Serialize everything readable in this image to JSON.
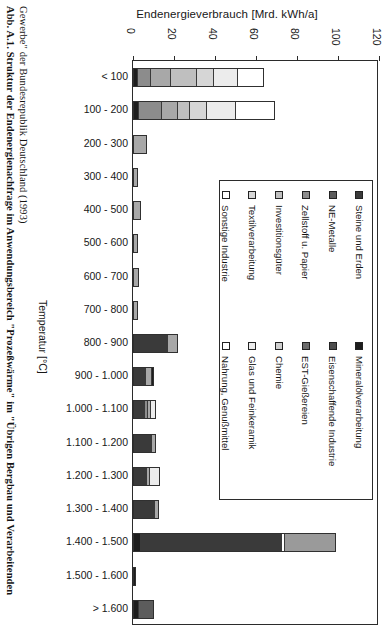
{
  "caption": {
    "line1_bold": "Abb. A.1.",
    "line1_rest": " Struktur der  Endenergienachfrage im Anwendungsb",
    "line1": "Abb. A.1. Struktur der  Endenergienachfrage im Anwendungsbereich \"Prozeßwärme\" im \"Übrigen Bergbau und Verarbeitenden",
    "line2": "Gewerbe\" der Bundesrepublik Deutschland (1993)"
  },
  "chart_data": {
    "type": "bar",
    "orientation": "horizontal-stacked",
    "title": "Endenergieverbrauch [Mrd. kWh/a]",
    "xlabel": "Endenergieverbrauch [Mrd. kWh/a]",
    "ylabel": "Temperatur [°C]",
    "xlim": [
      0,
      120
    ],
    "xticks": [
      0,
      20,
      40,
      60,
      80,
      100,
      120
    ],
    "grid": false,
    "legend_position": "inside-right",
    "categories": [
      "< 100",
      "100 - 200",
      "200 - 300",
      "300 - 400",
      "400 - 500",
      "500 - 600",
      "600 - 700",
      "700 - 800",
      "800 - 900",
      "900 - 1.000",
      "1.000 - 1.100",
      "1.100 - 1.200",
      "1.200 - 1.300",
      "1.300 - 1.400",
      "1.400 - 1.500",
      "1.500 - 1.600",
      "> 1.600"
    ],
    "series": [
      {
        "name": "Mineralölverarbeitung",
        "color": "#1d1d1d",
        "values": [
          1.8,
          2.2,
          0.0,
          0.0,
          0.0,
          0.0,
          0.0,
          0.0,
          0.3,
          0.3,
          0.0,
          0.0,
          0.0,
          0.0,
          3.0,
          1.2,
          0.0
        ]
      },
      {
        "name": "Eisenschaffende Industrie",
        "color": "#4d4d4d",
        "values": [
          0.0,
          0.0,
          0.0,
          0.0,
          0.0,
          0.0,
          0.0,
          0.0,
          0.0,
          0.0,
          0.0,
          0.0,
          0.0,
          0.0,
          0.0,
          0.0,
          0.0
        ]
      },
      {
        "name": "EST-Gießereien",
        "color": "#6b6b6b",
        "values": [
          0.0,
          0.0,
          0.0,
          0.0,
          0.0,
          0.0,
          0.0,
          0.0,
          0.0,
          0.0,
          0.0,
          0.0,
          0.0,
          0.0,
          0.0,
          0.0,
          0.0
        ]
      },
      {
        "name": "Steine und Erden",
        "color": "#3a3a3a",
        "values": [
          0.0,
          0.0,
          0.0,
          0.0,
          0.0,
          0.0,
          0.0,
          0.0,
          17.5,
          6.5,
          6.0,
          9.5,
          7.0,
          11.0,
          70.0,
          0.0,
          0.0
        ]
      },
      {
        "name": "NE-Metalle",
        "color": "#5c5c5c",
        "values": [
          0.0,
          0.0,
          0.0,
          0.0,
          0.0,
          0.0,
          0.0,
          0.0,
          0.0,
          0.0,
          0.0,
          0.0,
          0.0,
          0.0,
          1.0,
          0.0,
          0.0
        ]
      },
      {
        "name": "Zellstoff u. Papier",
        "color": "#8c8c8c",
        "values": [
          6.0,
          11.0,
          0.0,
          0.0,
          0.0,
          0.0,
          0.0,
          0.0,
          0.0,
          0.0,
          1.5,
          0.0,
          0.0,
          0.0,
          0.0,
          0.0,
          0.0
        ]
      },
      {
        "name": "Investitionsgüter",
        "color": "#a8a8a8",
        "values": [
          10.0,
          8.0,
          7.0,
          2.5,
          3.8,
          2.5,
          3.0,
          2.5,
          4.5,
          3.2,
          1.0,
          1.5,
          1.0,
          1.5,
          0.0,
          0.0,
          0.0
        ]
      },
      {
        "name": "Chemie",
        "color": "#bfbfbf",
        "values": [
          13.0,
          5.5,
          0.0,
          0.0,
          0.0,
          0.0,
          0.0,
          0.0,
          0.0,
          0.0,
          0.0,
          0.0,
          0.0,
          0.0,
          0.0,
          0.0,
          0.0
        ]
      },
      {
        "name": "Textilverarbeitung",
        "color": "#d6d6d6",
        "values": [
          8.0,
          8.5,
          0.0,
          0.0,
          0.0,
          0.0,
          0.0,
          0.0,
          0.0,
          0.0,
          0.0,
          0.0,
          0.0,
          0.0,
          0.0,
          0.0,
          0.0
        ]
      },
      {
        "name": "Glas und Feinkeramik",
        "color": "#ececec",
        "values": [
          12.0,
          14.5,
          0.0,
          0.0,
          0.0,
          0.0,
          0.0,
          0.0,
          0.0,
          0.0,
          2.5,
          0.0,
          5.0,
          0.0,
          25.0,
          0.0,
          0.0
        ]
      },
      {
        "name": "Sonstige Industrie",
        "color": "#ffffff",
        "values": [
          13.0,
          0.0,
          0.0,
          0.0,
          0.0,
          0.0,
          0.0,
          0.0,
          0.0,
          0.0,
          0.0,
          0.0,
          0.0,
          0.0,
          0.0,
          0.0,
          0.0
        ]
      },
      {
        "name": "Nahrung, Genußmittel",
        "color": "#ffffff",
        "values": [
          0.0,
          19.5,
          0.0,
          0.0,
          0.0,
          0.0,
          0.0,
          0.0,
          0.0,
          0.0,
          0.0,
          0.0,
          0.0,
          0.0,
          0.0,
          0.0,
          0.0
        ]
      }
    ],
    "totals": [
      63.8,
      69.2,
      7.0,
      2.5,
      3.8,
      2.5,
      3.0,
      2.5,
      22.3,
      10.0,
      11.0,
      11.0,
      13.0,
      12.5,
      99.0,
      1.2,
      10.0
    ],
    "bars": [
      {
        "category": "< 100",
        "segments": [
          {
            "n": "Mineralölverarbeitung",
            "c": "#1d1d1d",
            "v": 1.8
          },
          {
            "n": "Zellstoff u. Papier",
            "c": "#8c8c8c",
            "v": 6.0
          },
          {
            "n": "Investitionsgüter",
            "c": "#a8a8a8",
            "v": 10.0
          },
          {
            "n": "Chemie",
            "c": "#bfbfbf",
            "v": 13.0
          },
          {
            "n": "Textilverarbeitung",
            "c": "#d6d6d6",
            "v": 8.0
          },
          {
            "n": "Glas und Feinkeramik",
            "c": "#ececec",
            "v": 12.0
          },
          {
            "n": "Sonstige Industrie",
            "c": "#ffffff",
            "v": 13.0
          }
        ]
      },
      {
        "category": "100 - 200",
        "segments": [
          {
            "n": "Mineralölverarbeitung",
            "c": "#1d1d1d",
            "v": 2.2
          },
          {
            "n": "Zellstoff u. Papier",
            "c": "#8c8c8c",
            "v": 11.0
          },
          {
            "n": "Investitionsgüter",
            "c": "#a8a8a8",
            "v": 8.0
          },
          {
            "n": "Chemie",
            "c": "#bfbfbf",
            "v": 5.5
          },
          {
            "n": "Textilverarbeitung",
            "c": "#d6d6d6",
            "v": 8.5
          },
          {
            "n": "Glas und Feinkeramik",
            "c": "#ececec",
            "v": 14.5
          },
          {
            "n": "Nahrung, Genußmittel",
            "c": "#ffffff",
            "v": 19.5
          }
        ]
      },
      {
        "category": "200 - 300",
        "segments": [
          {
            "n": "Investitionsgüter",
            "c": "#a8a8a8",
            "v": 7.0
          }
        ]
      },
      {
        "category": "300 - 400",
        "segments": [
          {
            "n": "Investitionsgüter",
            "c": "#a8a8a8",
            "v": 2.5
          }
        ]
      },
      {
        "category": "400 - 500",
        "segments": [
          {
            "n": "Investitionsgüter",
            "c": "#a8a8a8",
            "v": 3.8
          }
        ]
      },
      {
        "category": "500 - 600",
        "segments": [
          {
            "n": "Investitionsgüter",
            "c": "#a8a8a8",
            "v": 2.5
          }
        ]
      },
      {
        "category": "600 - 700",
        "segments": [
          {
            "n": "Investitionsgüter",
            "c": "#a8a8a8",
            "v": 3.0
          }
        ]
      },
      {
        "category": "700 - 800",
        "segments": [
          {
            "n": "Investitionsgüter",
            "c": "#a8a8a8",
            "v": 2.5
          }
        ]
      },
      {
        "category": "800 - 900",
        "segments": [
          {
            "n": "Steine und Erden",
            "c": "#3a3a3a",
            "v": 17.5
          },
          {
            "n": "Investitionsgüter",
            "c": "#a8a8a8",
            "v": 4.5
          }
        ]
      },
      {
        "category": "900 - 1.000",
        "segments": [
          {
            "n": "Steine und Erden",
            "c": "#3a3a3a",
            "v": 6.5
          },
          {
            "n": "Investitionsgüter",
            "c": "#a8a8a8",
            "v": 3.2
          },
          {
            "n": "Mineralölverarbeitung",
            "c": "#1d1d1d",
            "v": 0.3
          }
        ]
      },
      {
        "category": "1.000 - 1.100",
        "segments": [
          {
            "n": "Steine und Erden",
            "c": "#3a3a3a",
            "v": 6.0
          },
          {
            "n": "Zellstoff u. Papier",
            "c": "#8c8c8c",
            "v": 1.5
          },
          {
            "n": "Investitionsgüter",
            "c": "#a8a8a8",
            "v": 1.0
          },
          {
            "n": "Glas und Feinkeramik",
            "c": "#ececec",
            "v": 2.5
          }
        ]
      },
      {
        "category": "1.100 - 1.200",
        "segments": [
          {
            "n": "Steine und Erden",
            "c": "#3a3a3a",
            "v": 9.5
          },
          {
            "n": "Investitionsgüter",
            "c": "#a8a8a8",
            "v": 1.5
          }
        ]
      },
      {
        "category": "1.200 - 1.300",
        "segments": [
          {
            "n": "Steine und Erden",
            "c": "#3a3a3a",
            "v": 7.0
          },
          {
            "n": "Investitionsgüter",
            "c": "#a8a8a8",
            "v": 1.0
          },
          {
            "n": "Glas und Feinkeramik",
            "c": "#ececec",
            "v": 5.0
          }
        ]
      },
      {
        "category": "1.300 - 1.400",
        "segments": [
          {
            "n": "Steine und Erden",
            "c": "#3a3a3a",
            "v": 11.0
          },
          {
            "n": "Investitionsgüter",
            "c": "#a8a8a8",
            "v": 1.5
          }
        ]
      },
      {
        "category": "1.400 - 1.500",
        "segments": [
          {
            "n": "Mineralölverarbeitung",
            "c": "#1d1d1d",
            "v": 3.0
          },
          {
            "n": "Steine und Erden",
            "c": "#3a3a3a",
            "v": 70.0
          },
          {
            "n": "NE-Metalle",
            "c": "#ffffff",
            "v": 1.0
          },
          {
            "n": "Glas und Feinkeramik",
            "c": "#9a9a9a",
            "v": 25.0
          }
        ]
      },
      {
        "category": "1.500 - 1.600",
        "segments": [
          {
            "n": "Mineralölverarbeitung",
            "c": "#1d1d1d",
            "v": 1.2
          }
        ]
      },
      {
        "category": "> 1.600",
        "segments": [
          {
            "n": "Mineralölverarbeitung",
            "c": "#1d1d1d",
            "v": 2.0
          },
          {
            "n": "Steine und Erden",
            "c": "#5c5c5c",
            "v": 8.0
          }
        ]
      }
    ]
  },
  "legend": {
    "columns": [
      {
        "items": [
          {
            "label": "Steine und Erden",
            "color": "#3a3a3a"
          },
          {
            "label": "NE-Metalle",
            "color": "#5c5c5c"
          },
          {
            "label": "Zellstoff u. Papier",
            "color": "#8c8c8c"
          },
          {
            "label": "Investitionsgüter",
            "color": "#bfbfbf"
          },
          {
            "label": "Textilverarbeitung",
            "color": "#d6d6d6"
          },
          {
            "label": "Sonstige Industrie",
            "color": "#ffffff"
          }
        ]
      },
      {
        "items": [
          {
            "label": "Mineralölverarbeitung",
            "color": "#1d1d1d"
          },
          {
            "label": "Eisenschaffende  Industrie",
            "color": "#4d4d4d"
          },
          {
            "label": "EST-Gießereien",
            "color": "#6b6b6b"
          },
          {
            "label": "Chemie",
            "color": "#d0d0d0"
          },
          {
            "label": "Glas und Feinkeramik",
            "color": "#ececec"
          },
          {
            "label": "Nahrung, Genußmittel",
            "color": "#ffffff"
          }
        ]
      }
    ]
  }
}
